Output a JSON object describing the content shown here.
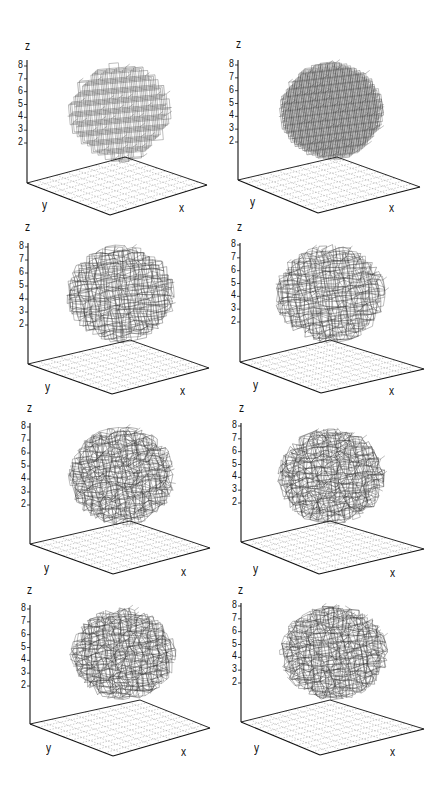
{
  "figure": {
    "layout": {
      "rows": 4,
      "cols": 2
    },
    "colors": {
      "wire": "#2a2a2a",
      "axis": "#111111",
      "floor_grid": "#9a9a9a",
      "background": "#ffffff"
    }
  },
  "chart_data": [
    {
      "type": "3d-wireframe-lattice",
      "panel": 1,
      "row": 1,
      "col": 1,
      "xlabel": "x",
      "ylabel": "y",
      "zlabel": "z",
      "zticks": [
        "2",
        "3",
        "4",
        "5",
        "6",
        "7",
        "8"
      ],
      "state": "regular cubic lattice",
      "distortion": 0.0,
      "density": 1.0,
      "geom": {
        "zlabel": [
          25,
          40
        ],
        "axis_top": [
          27,
          60
        ],
        "base_left": [
          27,
          183
        ],
        "back": [
          125,
          157
        ],
        "right": [
          207,
          185
        ],
        "front": [
          110,
          215
        ],
        "tick8": 66,
        "tick2": 143,
        "ylabel": [
          42,
          199
        ],
        "xlabel": [
          179,
          202
        ],
        "blob": [
          68,
          62,
          172,
          162
        ]
      }
    },
    {
      "type": "3d-wireframe-lattice",
      "panel": 2,
      "row": 1,
      "col": 2,
      "xlabel": "x",
      "ylabel": "y",
      "zlabel": "z",
      "zticks": [
        "2",
        "3",
        "4",
        "5",
        "6",
        "7",
        "8"
      ],
      "state": "regular cubic lattice (denser)",
      "distortion": 0.0,
      "density": 1.35,
      "geom": {
        "zlabel": [
          236,
          38
        ],
        "axis_top": [
          238,
          60
        ],
        "base_left": [
          238,
          180
        ],
        "back": [
          337,
          157
        ],
        "right": [
          420,
          187
        ],
        "front": [
          318,
          213
        ],
        "tick8": 65,
        "tick2": 142,
        "ylabel": [
          250,
          196
        ],
        "xlabel": [
          389,
          202
        ],
        "blob": [
          279,
          62,
          384,
          160
        ]
      }
    },
    {
      "type": "3d-wireframe-lattice",
      "panel": 3,
      "row": 2,
      "col": 1,
      "xlabel": "x",
      "ylabel": "y",
      "zlabel": "z",
      "zticks": [
        "2",
        "3",
        "4",
        "5",
        "6",
        "7",
        "8"
      ],
      "state": "thermally distorted lattice",
      "distortion": 0.55,
      "density": 1.1,
      "geom": {
        "zlabel": [
          25,
          221
        ],
        "axis_top": [
          28,
          243
        ],
        "base_left": [
          28,
          364
        ],
        "back": [
          130,
          340
        ],
        "right": [
          209,
          368
        ],
        "front": [
          112,
          394
        ],
        "tick8": 247,
        "tick2": 325,
        "ylabel": [
          45,
          381
        ],
        "xlabel": [
          180,
          385
        ],
        "blob": [
          66,
          245,
          176,
          343
        ]
      }
    },
    {
      "type": "3d-wireframe-lattice",
      "panel": 4,
      "row": 2,
      "col": 2,
      "xlabel": "x",
      "ylabel": "y",
      "zlabel": "z",
      "zticks": [
        "2",
        "3",
        "4",
        "5",
        "6",
        "7",
        "8"
      ],
      "state": "thermally distorted lattice",
      "distortion": 0.6,
      "density": 1.1,
      "geom": {
        "zlabel": [
          237,
          221
        ],
        "axis_top": [
          240,
          243
        ],
        "base_left": [
          240,
          362
        ],
        "back": [
          330,
          340
        ],
        "right": [
          424,
          369
        ],
        "front": [
          321,
          393
        ],
        "tick8": 245,
        "tick2": 322,
        "ylabel": [
          253,
          379
        ],
        "xlabel": [
          389,
          385
        ],
        "blob": [
          275,
          245,
          386,
          343
        ]
      }
    },
    {
      "type": "3d-wireframe-lattice",
      "panel": 5,
      "row": 3,
      "col": 1,
      "xlabel": "x",
      "ylabel": "y",
      "zlabel": "z",
      "zticks": [
        "2",
        "3",
        "4",
        "5",
        "6",
        "7",
        "8"
      ],
      "state": "strongly distorted lattice",
      "distortion": 0.75,
      "density": 1.15,
      "geom": {
        "zlabel": [
          27,
          402
        ],
        "axis_top": [
          30,
          423
        ],
        "base_left": [
          30,
          544
        ],
        "back": [
          130,
          521
        ],
        "right": [
          210,
          548
        ],
        "front": [
          113,
          574
        ],
        "tick8": 427,
        "tick2": 505,
        "ylabel": [
          44,
          562
        ],
        "xlabel": [
          181,
          566
        ],
        "blob": [
          68,
          427,
          176,
          525
        ]
      }
    },
    {
      "type": "3d-wireframe-lattice",
      "panel": 6,
      "row": 3,
      "col": 2,
      "xlabel": "x",
      "ylabel": "y",
      "zlabel": "z",
      "zticks": [
        "2",
        "3",
        "4",
        "5",
        "6",
        "7",
        "8"
      ],
      "state": "strongly distorted lattice",
      "distortion": 0.8,
      "density": 1.15,
      "geom": {
        "zlabel": [
          239,
          402
        ],
        "axis_top": [
          241,
          423
        ],
        "base_left": [
          241,
          542
        ],
        "back": [
          330,
          521
        ],
        "right": [
          424,
          549
        ],
        "front": [
          319,
          574
        ],
        "tick8": 426,
        "tick2": 503,
        "ylabel": [
          253,
          563
        ],
        "xlabel": [
          390,
          567
        ],
        "blob": [
          278,
          428,
          385,
          525
        ]
      }
    },
    {
      "type": "3d-wireframe-lattice",
      "panel": 7,
      "row": 4,
      "col": 1,
      "xlabel": "x",
      "ylabel": "y",
      "zlabel": "z",
      "zticks": [
        "2",
        "3",
        "4",
        "5",
        "6",
        "7",
        "8"
      ],
      "state": "distorted lattice, layered",
      "distortion": 0.7,
      "density": 1.15,
      "geom": {
        "zlabel": [
          27,
          584
        ],
        "axis_top": [
          30,
          605
        ],
        "base_left": [
          30,
          724
        ],
        "back": [
          140,
          700
        ],
        "right": [
          210,
          728
        ],
        "front": [
          113,
          756
        ],
        "tick8": 609,
        "tick2": 686,
        "ylabel": [
          46,
          742
        ],
        "xlabel": [
          181,
          746
        ],
        "blob": [
          70,
          608,
          176,
          700
        ]
      }
    },
    {
      "type": "3d-wireframe-lattice",
      "panel": 8,
      "row": 4,
      "col": 2,
      "xlabel": "x",
      "ylabel": "y",
      "zlabel": "z",
      "zticks": [
        "2",
        "3",
        "4",
        "5",
        "6",
        "7",
        "8"
      ],
      "state": "distorted lattice, layered",
      "distortion": 0.72,
      "density": 1.15,
      "geom": {
        "zlabel": [
          238,
          584
        ],
        "axis_top": [
          241,
          603
        ],
        "base_left": [
          241,
          722
        ],
        "back": [
          330,
          700
        ],
        "right": [
          424,
          729
        ],
        "front": [
          320,
          755
        ],
        "tick8": 606,
        "tick2": 683,
        "ylabel": [
          254,
          742
        ],
        "xlabel": [
          390,
          746
        ],
        "blob": [
          280,
          605,
          388,
          700
        ]
      }
    }
  ]
}
